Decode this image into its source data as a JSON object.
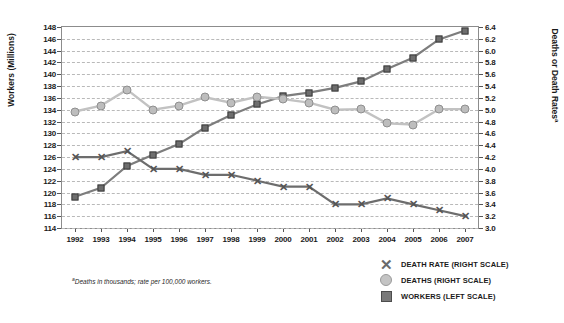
{
  "axes": {
    "ylabel_left": "Workers (Millions)",
    "ylabel_right": "Deaths or Death Rates",
    "ylabel_right_sup": "a",
    "left_ticks": [
      "148",
      "146",
      "144",
      "142",
      "140",
      "138",
      "136",
      "134",
      "132",
      "130",
      "128",
      "126",
      "124",
      "122",
      "120",
      "118",
      "116",
      "114"
    ],
    "right_ticks": [
      "6.4",
      "6.2",
      "6.0",
      "5.8",
      "5.6",
      "5.4",
      "5.2",
      "5.0",
      "4.8",
      "4.6",
      "4.4",
      "4.2",
      "4.0",
      "3.8",
      "3.6",
      "3.4",
      "3.2",
      "3.0"
    ],
    "x_ticks": [
      "1992",
      "1993",
      "1994",
      "1995",
      "1996",
      "1997",
      "1998",
      "1999",
      "2000",
      "2001",
      "2002",
      "2003",
      "2004",
      "2005",
      "2006",
      "2007"
    ]
  },
  "footnote": {
    "marker": "a",
    "text": "Deaths in thousands; rate per 100,000 workers."
  },
  "legend": {
    "items": [
      {
        "label": "DEATH RATE (RIGHT SCALE)",
        "marker": "x-marker",
        "color": "#6a6a6a"
      },
      {
        "label": "DEATHS (RIGHT SCALE)",
        "marker": "circle-marker",
        "color": "#c4c4c4"
      },
      {
        "label": "WORKERS (LEFT SCALE)",
        "marker": "square-marker",
        "color": "#7a7a7a"
      }
    ]
  },
  "chart_data": {
    "type": "line",
    "title": "",
    "xlabel": "",
    "ylabel": "Workers (Millions)",
    "ylabel_secondary": "Deaths or Death Rates",
    "grid": true,
    "legend_position": "bottom-right",
    "x": [
      1992,
      1993,
      1994,
      1995,
      1996,
      1997,
      1998,
      1999,
      2000,
      2001,
      2002,
      2003,
      2004,
      2005,
      2006,
      2007
    ],
    "ylim": [
      114,
      148
    ],
    "ylim_secondary": [
      3.0,
      6.4
    ],
    "series": [
      {
        "name": "WORKERS (LEFT SCALE)",
        "axis": "left",
        "marker": "square",
        "color": "#6e6e6e",
        "unit": "millions",
        "values": [
          119.3,
          120.8,
          124.5,
          126.4,
          128.2,
          131.0,
          133.1,
          134.9,
          136.3,
          136.9,
          137.7,
          138.8,
          140.9,
          142.8,
          145.9,
          147.4
        ]
      },
      {
        "name": "DEATHS (RIGHT SCALE)",
        "axis": "right",
        "marker": "circle",
        "color": "#bdbdbd",
        "unit": "thousands",
        "values": [
          4.97,
          5.07,
          5.34,
          5.0,
          5.07,
          5.21,
          5.12,
          5.22,
          5.18,
          5.12,
          5.0,
          5.01,
          4.77,
          4.75,
          5.01,
          5.01
        ]
      },
      {
        "name": "DEATH RATE (RIGHT SCALE)",
        "axis": "right",
        "marker": "x",
        "color": "#555555",
        "unit": "per 100,000 workers",
        "values": [
          4.2,
          4.2,
          4.3,
          4.0,
          4.0,
          3.9,
          3.9,
          3.8,
          3.7,
          3.7,
          3.4,
          3.4,
          3.5,
          3.4,
          3.3,
          3.2
        ]
      }
    ],
    "deaths_plot_values": [
      4.97,
      5.07,
      5.34,
      5.0,
      5.07,
      5.21,
      5.12,
      5.22,
      5.18,
      5.12,
      5.0,
      5.01,
      4.77,
      4.75,
      5.01,
      5.01
    ],
    "deaths_right_tail": [
      5.01,
      5.0,
      5.0,
      4.7
    ]
  }
}
